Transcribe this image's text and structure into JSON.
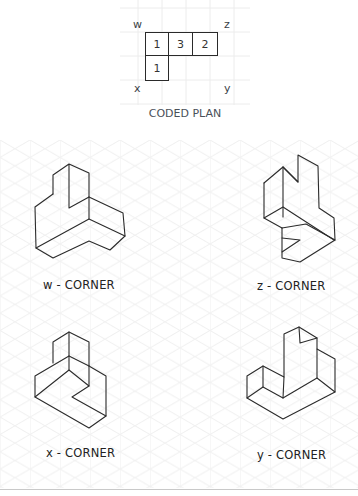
{
  "plan": {
    "title": "CODED PLAN",
    "corners": {
      "w": "w",
      "z": "z",
      "x": "x",
      "y": "y"
    },
    "cells": [
      {
        "row": 0,
        "col": 0,
        "value": "1"
      },
      {
        "row": 0,
        "col": 1,
        "value": "3"
      },
      {
        "row": 0,
        "col": 2,
        "value": "2"
      },
      {
        "row": 1,
        "col": 0,
        "value": "1"
      }
    ]
  },
  "figures": [
    {
      "id": "w",
      "label": "w - CORNER"
    },
    {
      "id": "z",
      "label": "z - CORNER"
    },
    {
      "id": "x",
      "label": "x - CORNER"
    },
    {
      "id": "y",
      "label": "y - CORNER"
    }
  ],
  "colors": {
    "line": "#2b2b2b",
    "grid": "#ececec",
    "label": "#222222",
    "plan_text": "#4a5058",
    "separator": "#c9c9c9"
  }
}
